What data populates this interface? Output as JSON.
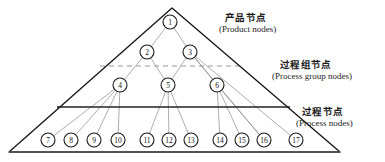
{
  "figure": {
    "background": "#ffffff",
    "width": 385,
    "height": 162
  },
  "colors": {
    "outline": "#1a1a1a",
    "edge": "#8a8a8a",
    "divider_solid": "#222222",
    "divider_dashed": "#8a8a8a",
    "node_stroke": "#1a1a1a",
    "node_fill": "#ffffff",
    "text": "#111111"
  },
  "labels": [
    {
      "id": "product",
      "cn": "产品节点",
      "en": "(Product nodes)"
    },
    {
      "id": "process_group",
      "cn": "过程组节点",
      "en": "(Process group nodes)"
    },
    {
      "id": "process",
      "cn": "过程节点",
      "en": "(Process nodes)"
    }
  ],
  "triangle": {
    "apex": [
      172,
      8
    ],
    "left": [
      9,
      152
    ],
    "right": [
      340,
      152
    ]
  },
  "dividers": [
    {
      "id": "dashed-divider",
      "style": "dashed",
      "y": 66,
      "x1": 100,
      "x2": 242
    },
    {
      "id": "solid-divider",
      "style": "solid",
      "y": 107,
      "x1": 57,
      "x2": 290
    }
  ],
  "nodes": [
    {
      "id": 1,
      "label": "1",
      "x": 170,
      "y": 22,
      "level": "product"
    },
    {
      "id": 2,
      "label": "2",
      "x": 147,
      "y": 52,
      "level": "process_group"
    },
    {
      "id": 3,
      "label": "3",
      "x": 190,
      "y": 52,
      "level": "process_group"
    },
    {
      "id": 4,
      "label": "4",
      "x": 120,
      "y": 85,
      "level": "process_group"
    },
    {
      "id": 5,
      "label": "5",
      "x": 168,
      "y": 85,
      "level": "process_group"
    },
    {
      "id": 6,
      "label": "6",
      "x": 217,
      "y": 85,
      "level": "process_group"
    },
    {
      "id": 7,
      "label": "7",
      "x": 48,
      "y": 140,
      "level": "process"
    },
    {
      "id": 8,
      "label": "8",
      "x": 71,
      "y": 140,
      "level": "process"
    },
    {
      "id": 9,
      "label": "9",
      "x": 94,
      "y": 140,
      "level": "process"
    },
    {
      "id": 10,
      "label": "10",
      "x": 118,
      "y": 140,
      "level": "process"
    },
    {
      "id": 11,
      "label": "11",
      "x": 147,
      "y": 140,
      "level": "process"
    },
    {
      "id": 12,
      "label": "12",
      "x": 169,
      "y": 140,
      "level": "process"
    },
    {
      "id": 13,
      "label": "13",
      "x": 191,
      "y": 140,
      "level": "process"
    },
    {
      "id": 14,
      "label": "14",
      "x": 220,
      "y": 140,
      "level": "process"
    },
    {
      "id": 15,
      "label": "15",
      "x": 242,
      "y": 140,
      "level": "process"
    },
    {
      "id": 16,
      "label": "16",
      "x": 264,
      "y": 140,
      "level": "process"
    },
    {
      "id": 17,
      "label": "17",
      "x": 296,
      "y": 140,
      "level": "process"
    }
  ],
  "edges": [
    {
      "from": 1,
      "to": 2
    },
    {
      "from": 1,
      "to": 3
    },
    {
      "from": 2,
      "to": 4
    },
    {
      "from": 2,
      "to": 5
    },
    {
      "from": 3,
      "to": 5
    },
    {
      "from": 3,
      "to": 6
    },
    {
      "from": 3,
      "to": 16
    },
    {
      "from": 3,
      "to": 17
    },
    {
      "from": 4,
      "to": 7
    },
    {
      "from": 4,
      "to": 8
    },
    {
      "from": 4,
      "to": 9
    },
    {
      "from": 4,
      "to": 10
    },
    {
      "from": 5,
      "to": 11
    },
    {
      "from": 5,
      "to": 12
    },
    {
      "from": 5,
      "to": 13
    },
    {
      "from": 6,
      "to": 14
    },
    {
      "from": 6,
      "to": 15
    },
    {
      "from": 6,
      "to": 16
    }
  ],
  "node_radius": 7
}
